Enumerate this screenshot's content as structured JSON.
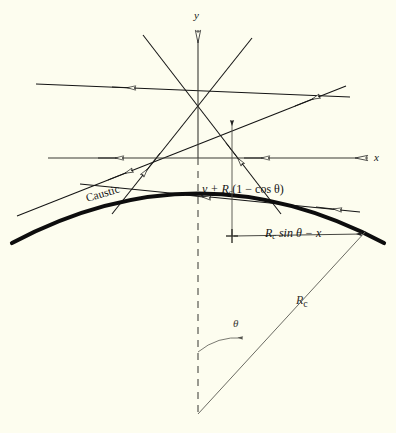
{
  "figure": {
    "background_color": "#fdfdef",
    "ink_color": "#141414",
    "thin_ink_color": "#6e6e66",
    "width": 396,
    "height": 433
  },
  "axes": {
    "y_label": "y",
    "x_label": "x",
    "y_axis_name": "vertical axis",
    "x_axis_name": "horizontal axis",
    "origin": {
      "x": 198,
      "y": 158
    }
  },
  "labels": {
    "caustic": "Caustic",
    "vertical_dimension": "y + Rc(1 − cos θ)",
    "vertical_dimension_parts": {
      "lead": "y + R",
      "sub": "c",
      "tail": "(1 − cos θ)"
    },
    "horizontal_dimension": "Rc sin θ − x",
    "horizontal_dimension_parts": {
      "lead": "R",
      "sub": "c",
      "tail": " sin θ − x"
    },
    "radius": "Rc",
    "radius_parts": {
      "lead": "R",
      "sub": "c"
    },
    "angle": "θ"
  },
  "geometry": {
    "caustic_curve": "M 12,243 Q 198,146 384,243",
    "caustic_stroke_width": 4,
    "y_axis_line": {
      "x1": 198,
      "y1": 22,
      "x2": 198,
      "y2": 158
    },
    "x_axis_line": {
      "x1": 48,
      "y1": 158,
      "x2": 366,
      "y2": 158
    },
    "dashed_axis": {
      "x1": 198,
      "y1": 158,
      "x2": 198,
      "y2": 414
    },
    "apex": {
      "x": 198,
      "y": 414
    },
    "upper_focus": {
      "x": 198,
      "y": 82
    },
    "lower_focus": {
      "x": 198,
      "y": 146
    },
    "radius_line": {
      "x1": 198,
      "y1": 414,
      "x2": 366,
      "y2": 232
    },
    "angle_arc": "M 198,355 A 58,58 0 0 1 240,340",
    "vertical_measure_line": {
      "x": 232,
      "y_top": 117,
      "y_bottom": 236
    },
    "horizontal_measure_line": {
      "y": 236,
      "x_left": 232,
      "x_right": 364
    }
  },
  "rays": [
    {
      "name": "ray-upper-left-steep",
      "x1": 143,
      "y1": 35,
      "x2": 280,
      "y2": 213,
      "arrow_t": 0.72
    },
    {
      "name": "ray-upper-right-steep",
      "x1": 252,
      "y1": 38,
      "x2": 112,
      "y2": 213,
      "arrow_t": 0.74
    },
    {
      "name": "ray-left-shallow",
      "x1": 36,
      "y1": 84,
      "x2": 350,
      "y2": 96,
      "arrow_t": 0.33
    },
    {
      "name": "ray-left-diagonal",
      "x1": 17,
      "y1": 216,
      "x2": 345,
      "y2": 86,
      "arrow_t": 0.3
    },
    {
      "name": "ray-horizontal-axis-ray",
      "x1": 48,
      "y1": 158,
      "x2": 366,
      "y2": 158,
      "arrow_t": 0.33
    },
    {
      "name": "ray-lower-shallow",
      "x1": 80,
      "y1": 184,
      "x2": 360,
      "y2": 210,
      "arrow_t": 0.52
    }
  ],
  "arrowheads": {
    "style": "hollow",
    "axis_style": "hollow-elongated"
  }
}
